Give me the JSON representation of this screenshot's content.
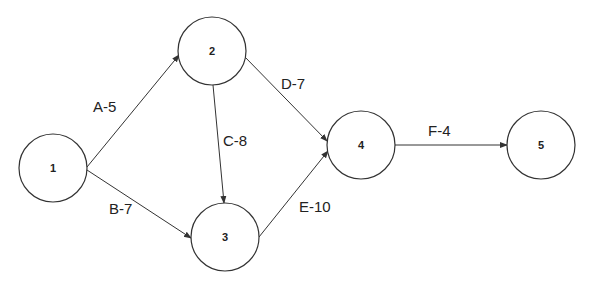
{
  "diagram": {
    "type": "activity-on-arrow network",
    "nodes": [
      {
        "id": "1",
        "label": "1",
        "cx": 53,
        "cy": 168,
        "r": 34
      },
      {
        "id": "2",
        "label": "2",
        "cx": 212,
        "cy": 51,
        "r": 34
      },
      {
        "id": "3",
        "label": "3",
        "cx": 225,
        "cy": 237,
        "r": 34
      },
      {
        "id": "4",
        "label": "4",
        "cx": 361,
        "cy": 145,
        "r": 34
      },
      {
        "id": "5",
        "label": "5",
        "cx": 541,
        "cy": 145,
        "r": 34
      }
    ],
    "edges": [
      {
        "from": "1",
        "to": "2",
        "activity": "A",
        "duration": 5,
        "label": "A-5",
        "x1": 87,
        "y1": 167,
        "x2": 179,
        "y2": 55,
        "lx": 93,
        "ly": 106
      },
      {
        "from": "1",
        "to": "3",
        "activity": "B",
        "duration": 7,
        "label": "B-7",
        "x1": 87,
        "y1": 170,
        "x2": 191,
        "y2": 238,
        "lx": 109,
        "ly": 208
      },
      {
        "from": "2",
        "to": "3",
        "activity": "C",
        "duration": 8,
        "label": "C-8",
        "x1": 213,
        "y1": 85,
        "x2": 224,
        "y2": 203,
        "lx": 223,
        "ly": 140
      },
      {
        "from": "2",
        "to": "4",
        "activity": "D",
        "duration": 7,
        "label": "D-7",
        "x1": 244,
        "y1": 56,
        "x2": 327,
        "y2": 141,
        "lx": 281,
        "ly": 83
      },
      {
        "from": "3",
        "to": "4",
        "activity": "E",
        "duration": 10,
        "label": "E-10",
        "x1": 259,
        "y1": 237,
        "x2": 328,
        "y2": 151,
        "lx": 299,
        "ly": 206
      },
      {
        "from": "4",
        "to": "5",
        "activity": "F",
        "duration": 4,
        "label": "F-4",
        "x1": 395,
        "y1": 145,
        "x2": 507,
        "y2": 145,
        "lx": 428,
        "ly": 130
      }
    ]
  }
}
